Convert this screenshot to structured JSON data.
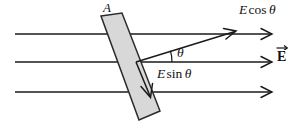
{
  "figure": {
    "canvas": {
      "width": 302,
      "height": 125,
      "background": "#ffffff"
    },
    "colors": {
      "line": "#1a1a1a",
      "slab_fill": "#d8d8d8",
      "slab_stroke": "#2b2b2b",
      "text": "#111111"
    },
    "labels": {
      "area": "A",
      "e_cos_theta": {
        "symbol": "E",
        "function": "cos",
        "angle": "θ",
        "full": "E cos θ"
      },
      "e_sin_theta": {
        "symbol": "E",
        "function": "sin",
        "angle": "θ",
        "full": "E sin θ"
      },
      "theta": "θ",
      "e_field_vector": "E"
    },
    "field_lines": {
      "count": 3,
      "y_positions": [
        34,
        62,
        92
      ],
      "x_start": 15,
      "x_end": 272,
      "arrowheads": "open-v",
      "direction": "right"
    },
    "slab": {
      "shape": "rotated-rectangle",
      "fill": "#d8d8d8",
      "corners": [
        [
          101,
          16
        ],
        [
          122,
          13
        ],
        [
          160,
          111
        ],
        [
          139,
          120
        ]
      ],
      "tilt_description": "tilted plane of area A"
    },
    "component_vectors": [
      {
        "name": "E cos theta",
        "from": [
          136,
          62
        ],
        "to": [
          236,
          31
        ],
        "label": "E cos θ",
        "description": "component parallel to surface normal projection"
      },
      {
        "name": "E sin theta",
        "from": [
          136,
          62
        ],
        "to": [
          151,
          97
        ],
        "label": "E sin θ",
        "description": "component along the tilted surface"
      }
    ],
    "angle_arc": {
      "vertex": [
        136,
        62
      ],
      "radius": 36,
      "label": "θ",
      "between": [
        "horizontal field line",
        "E cos θ vector"
      ]
    }
  }
}
